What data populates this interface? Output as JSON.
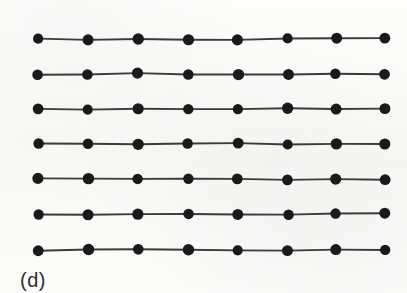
{
  "figure": {
    "caption": "(d)",
    "background_color": "#fbfbfa",
    "node_color": "#1a1a1a",
    "edge_color": "#3a3a3a",
    "node_radius": 5.4,
    "edge_width": 1.9,
    "rows": 7,
    "columns": 8,
    "node_count": 56,
    "edge_count": 49
  },
  "chart_data": {
    "type": "scatter",
    "title": "",
    "subtitle": "",
    "xlabel": "",
    "ylabel": "",
    "grid": false,
    "legend_position": "none",
    "annotations": [
      "(d)"
    ],
    "xlim": [
      0,
      407
    ],
    "ylim": [
      0,
      293
    ],
    "columns_x": [
      38,
      88,
      138,
      188,
      238,
      288,
      336,
      385
    ],
    "rows_y": [
      39,
      74,
      109,
      144,
      179,
      214,
      250
    ],
    "series": [
      {
        "name": "row-1",
        "y": 39,
        "values": [
          38,
          88,
          138,
          188,
          238,
          288,
          336,
          385
        ]
      },
      {
        "name": "row-2",
        "y": 74,
        "values": [
          38,
          88,
          138,
          188,
          238,
          288,
          336,
          385
        ]
      },
      {
        "name": "row-3",
        "y": 109,
        "values": [
          38,
          88,
          138,
          188,
          238,
          288,
          336,
          385
        ]
      },
      {
        "name": "row-4",
        "y": 144,
        "values": [
          38,
          88,
          138,
          188,
          238,
          288,
          336,
          385
        ]
      },
      {
        "name": "row-5",
        "y": 179,
        "values": [
          38,
          88,
          138,
          188,
          238,
          288,
          336,
          385
        ]
      },
      {
        "name": "row-6",
        "y": 214,
        "values": [
          38,
          88,
          138,
          188,
          238,
          288,
          336,
          385
        ]
      },
      {
        "name": "row-7",
        "y": 250,
        "values": [
          38,
          88,
          138,
          188,
          238,
          288,
          336,
          385
        ]
      }
    ]
  }
}
